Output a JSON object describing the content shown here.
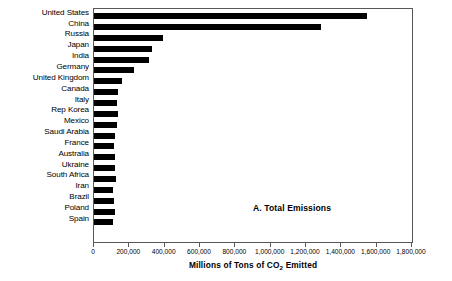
{
  "chart_data": {
    "type": "bar",
    "orientation": "horizontal",
    "title": "A. Total Emissions",
    "xlabel_prefix": "Millions of Tons of CO",
    "xlabel_sub": "2",
    "xlabel_suffix": " Emitted",
    "ylabel": "",
    "xlim": [
      0,
      1800000
    ],
    "grid": false,
    "legend": null,
    "bar_color": "#000000",
    "frame_color": "#585858",
    "xticks": [
      0,
      200000,
      400000,
      600000,
      800000,
      1000000,
      1200000,
      1400000,
      1600000,
      1800000
    ],
    "xtick_labels": [
      "0",
      "200,000",
      "400,000",
      "600,000",
      "800,000",
      "1,000,000",
      "1,200,000",
      "1,400,000",
      "1,600,000",
      "1,800,000"
    ],
    "categories": [
      "United States",
      "China",
      "Russia",
      "Japan",
      "India",
      "Germany",
      "United Kingdom",
      "Canada",
      "Italy",
      "Rep Korea",
      "Mexico",
      "Saudi Arabia",
      "France",
      "Australia",
      "Ukraine",
      "South Africa",
      "Iran",
      "Brazil",
      "Poland",
      "Spain"
    ],
    "values": [
      1543000,
      1285000,
      393000,
      331000,
      309000,
      224000,
      157000,
      135000,
      129000,
      135000,
      129000,
      118000,
      112000,
      118000,
      118000,
      123000,
      107000,
      112000,
      118000,
      107000
    ]
  }
}
